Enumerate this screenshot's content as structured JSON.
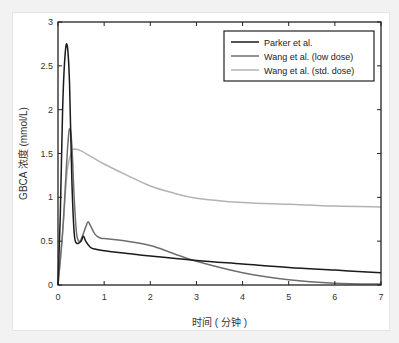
{
  "chart_data": {
    "type": "line",
    "title": "",
    "xlabel": "时间 ( 分钟 )",
    "ylabel": "GBCA 浓度 (mmol/L)",
    "xlim": [
      0,
      7
    ],
    "ylim": [
      0,
      3
    ],
    "xticks": [
      0,
      1,
      2,
      3,
      4,
      5,
      6,
      7
    ],
    "yticks": [
      0,
      0.5,
      1,
      1.5,
      2,
      2.5,
      3
    ],
    "ytick_labels": [
      "0",
      "0.5",
      "1",
      "1.5",
      "2",
      "2.5",
      "3"
    ],
    "grid": false,
    "legend_position": "upper right",
    "series": [
      {
        "name": "Parker et al.",
        "color": "#1a1a1a",
        "x": [
          0,
          0.05,
          0.1,
          0.15,
          0.2,
          0.25,
          0.3,
          0.35,
          0.4,
          0.5,
          0.55,
          0.6,
          0.7,
          0.8,
          1.0,
          1.5,
          2,
          3,
          4,
          5,
          6,
          7
        ],
        "y": [
          0,
          0.8,
          2.0,
          2.6,
          2.73,
          2.3,
          1.2,
          0.6,
          0.48,
          0.5,
          0.56,
          0.5,
          0.43,
          0.41,
          0.39,
          0.36,
          0.33,
          0.28,
          0.24,
          0.2,
          0.17,
          0.14
        ]
      },
      {
        "name": "Wang et al. (low dose)",
        "color": "#6e6e6e",
        "x": [
          0,
          0.1,
          0.2,
          0.25,
          0.3,
          0.35,
          0.4,
          0.45,
          0.5,
          0.6,
          0.65,
          0.7,
          0.8,
          0.9,
          1.0,
          1.5,
          2,
          2.5,
          3,
          4,
          5,
          6,
          7
        ],
        "y": [
          0,
          0.6,
          1.5,
          1.78,
          1.6,
          1.0,
          0.6,
          0.5,
          0.52,
          0.66,
          0.72,
          0.68,
          0.58,
          0.54,
          0.53,
          0.5,
          0.45,
          0.36,
          0.27,
          0.14,
          0.06,
          0.02,
          0.01
        ]
      },
      {
        "name": "Wang et al. (std. dose)",
        "color": "#b3b3b3",
        "x": [
          0,
          0.1,
          0.2,
          0.3,
          0.35,
          0.5,
          0.7,
          1.0,
          1.5,
          2,
          2.5,
          3,
          4,
          5,
          6,
          7
        ],
        "y": [
          0,
          0.6,
          1.3,
          1.52,
          1.55,
          1.53,
          1.47,
          1.38,
          1.25,
          1.13,
          1.05,
          0.99,
          0.94,
          0.92,
          0.9,
          0.89
        ]
      }
    ]
  }
}
